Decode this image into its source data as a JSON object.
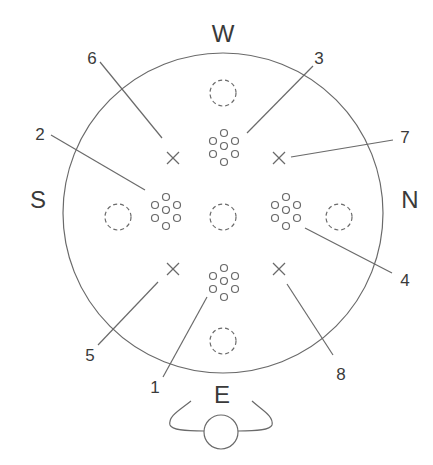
{
  "directions": {
    "top": "W",
    "left": "S",
    "right": "N",
    "bottom": "E"
  },
  "callouts": [
    "1",
    "2",
    "3",
    "4",
    "5",
    "6",
    "7",
    "8"
  ],
  "colors": {
    "line": "#6a6a6a",
    "text": "#3a3a3a",
    "background": "#ffffff"
  }
}
